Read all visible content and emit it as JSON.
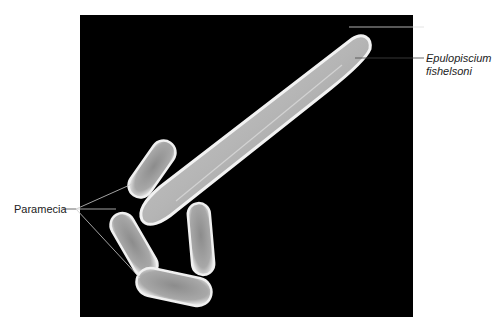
{
  "figure": {
    "labels": {
      "epulopiscium_line1": "Epulopiscium",
      "epulopiscium_line2": "fishelsoni",
      "paramecia": "Paramecia"
    },
    "colors": {
      "background": "#ffffff",
      "photo_background": "#000000",
      "cell_fill": "#9a9a9a",
      "cell_highlight": "#e8e8e8",
      "leader_line": "#444444",
      "label_text": "#222222"
    }
  }
}
